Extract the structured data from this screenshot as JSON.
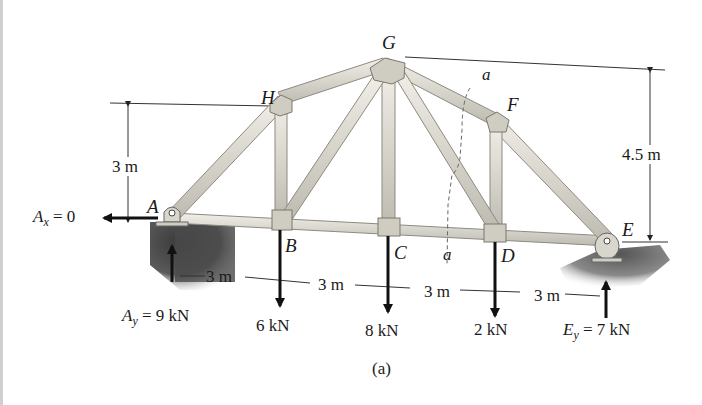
{
  "figure": {
    "caption": "(a)",
    "type": "truss-free-body-diagram"
  },
  "joints": {
    "A": "A",
    "B": "B",
    "C": "C",
    "D": "D",
    "E": "E",
    "F": "F",
    "G": "G",
    "H": "H"
  },
  "section_cut": {
    "label_top": "a",
    "label_bottom": "a"
  },
  "dimensions": {
    "height_H": "3 m",
    "height_G": "4.5 m",
    "spans": [
      "3 m",
      "3 m",
      "3 m",
      "3 m"
    ]
  },
  "reactions": {
    "Ax": {
      "symbol": "A",
      "sub": "x",
      "value": "= 0"
    },
    "Ay": {
      "symbol": "A",
      "sub": "y",
      "value": "= 9 kN"
    },
    "Ey": {
      "symbol": "E",
      "sub": "y",
      "value": "= 7 kN"
    }
  },
  "loads": {
    "B": "6 kN",
    "C": "8 kN",
    "D": "2 kN"
  },
  "colors": {
    "member": "#d9d6cc",
    "member_edge": "#8d8a80",
    "ground": "#4a4a4a",
    "arrow": "#111111"
  }
}
